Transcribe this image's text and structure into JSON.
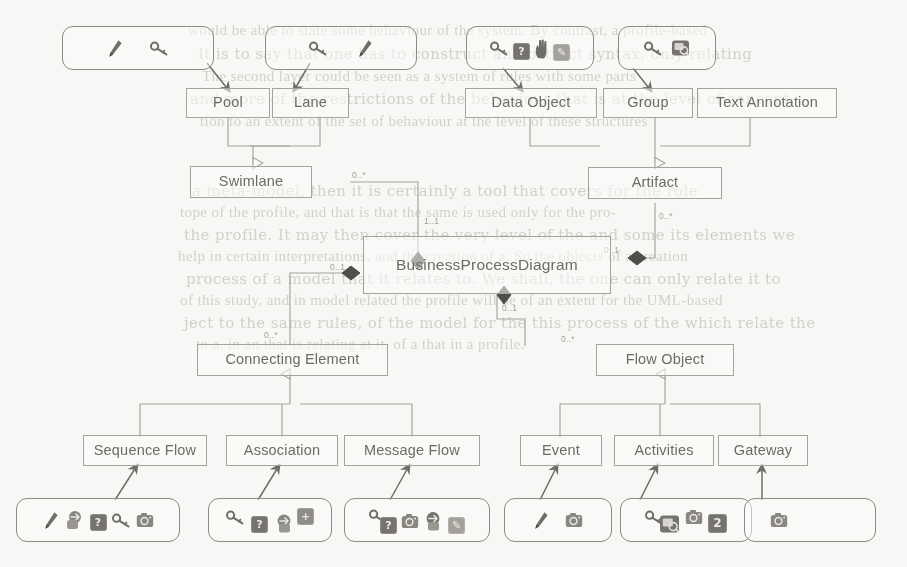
{
  "diagram": {
    "stroke_color": "#a8a49c",
    "text_color": "#6d6a64",
    "page_background": "#fbfbf9"
  },
  "nodes": [
    {
      "id": "pool",
      "label": "Pool"
    },
    {
      "id": "lane",
      "label": "Lane"
    },
    {
      "id": "swimlane",
      "label": "Swimlane"
    },
    {
      "id": "dataobject",
      "label": "Data Object"
    },
    {
      "id": "group",
      "label": "Group"
    },
    {
      "id": "textannot",
      "label": "Text Annotation"
    },
    {
      "id": "artifact",
      "label": "Artifact"
    },
    {
      "id": "bpd",
      "label": "BusinessProcessDiagram"
    },
    {
      "id": "connecting",
      "label": "Connecting Element"
    },
    {
      "id": "flowobject",
      "label": "Flow Object"
    },
    {
      "id": "seqflow",
      "label": "Sequence Flow"
    },
    {
      "id": "assoc",
      "label": "Association"
    },
    {
      "id": "msgflow",
      "label": "Message Flow"
    },
    {
      "id": "event",
      "label": "Event"
    },
    {
      "id": "activities",
      "label": "Activities"
    },
    {
      "id": "gateway",
      "label": "Gateway"
    }
  ],
  "multiplicities": [
    {
      "id": "m-swimlane-src",
      "text": "0..*"
    },
    {
      "id": "m-swimlane-dst",
      "text": "1..1"
    },
    {
      "id": "m-artifact-src",
      "text": "0..*"
    },
    {
      "id": "m-artifact-dst",
      "text": "0..1"
    },
    {
      "id": "m-connect-src",
      "text": "0..*"
    },
    {
      "id": "m-connect-dst",
      "text": "0..1"
    },
    {
      "id": "m-flowobj-dst",
      "text": "0..1"
    },
    {
      "id": "m-flowobj-src",
      "text": "0..*"
    }
  ],
  "palettes": [
    {
      "id": "palette-pool",
      "target": "Pool",
      "icons": [
        {
          "name": "pen-icon",
          "glyph": ""
        },
        {
          "name": "key-icon",
          "glyph": ""
        }
      ]
    },
    {
      "id": "palette-lane",
      "target": "Lane",
      "icons": [
        {
          "name": "key-icon",
          "glyph": ""
        },
        {
          "name": "pen-icon",
          "glyph": ""
        }
      ]
    },
    {
      "id": "palette-dataobject",
      "target": "Data Object",
      "icons": [
        {
          "name": "key-icon",
          "glyph": ""
        },
        {
          "name": "question-box-icon",
          "glyph": "?"
        },
        {
          "name": "hand-icon",
          "glyph": ""
        },
        {
          "name": "edit-note-icon",
          "glyph": "✎"
        }
      ]
    },
    {
      "id": "palette-group",
      "target": "Group",
      "icons": [
        {
          "name": "key-icon",
          "glyph": ""
        },
        {
          "name": "image-tag-icon",
          "glyph": ""
        }
      ]
    },
    {
      "id": "palette-sequence-flow",
      "target": "Sequence Flow",
      "icons": [
        {
          "name": "pen-icon",
          "glyph": ""
        },
        {
          "name": "link-badge-icon",
          "glyph": ""
        },
        {
          "name": "question-box-icon",
          "glyph": "?"
        },
        {
          "name": "key-icon",
          "glyph": ""
        },
        {
          "name": "camera-icon",
          "glyph": ""
        }
      ]
    },
    {
      "id": "palette-association",
      "target": "Association",
      "icons": [
        {
          "name": "key-icon",
          "glyph": ""
        },
        {
          "name": "question-box-icon",
          "glyph": "?"
        },
        {
          "name": "link-badge-icon",
          "glyph": ""
        },
        {
          "name": "plus-box-icon",
          "glyph": "+"
        }
      ]
    },
    {
      "id": "palette-message-flow",
      "target": "Message Flow",
      "icons": [
        {
          "name": "key-icon",
          "glyph": ""
        },
        {
          "name": "question-box-icon",
          "glyph": "?"
        },
        {
          "name": "camera-icon",
          "glyph": ""
        },
        {
          "name": "link-badge-icon",
          "glyph": ""
        },
        {
          "name": "edit-note-icon",
          "glyph": "✎"
        }
      ]
    },
    {
      "id": "palette-event",
      "target": "Event",
      "icons": [
        {
          "name": "pen-icon",
          "glyph": ""
        },
        {
          "name": "camera-icon",
          "glyph": ""
        }
      ]
    },
    {
      "id": "palette-activities",
      "target": "Activities",
      "icons": [
        {
          "name": "key-icon",
          "glyph": ""
        },
        {
          "name": "image-tag-icon",
          "glyph": ""
        },
        {
          "name": "camera-icon",
          "glyph": ""
        },
        {
          "name": "number-2-icon",
          "glyph": "2"
        }
      ]
    },
    {
      "id": "palette-gateway",
      "target": "Gateway",
      "icons": [
        {
          "name": "camera-icon",
          "glyph": ""
        }
      ]
    }
  ],
  "background_bleed": [
    {
      "text": "would be able to state some behaviour of the system. By contrast, a profile-based",
      "x": 188,
      "y": 22,
      "size": 15
    },
    {
      "text": "It is to say that one has to construct an abstract syntax, only relating",
      "x": 198,
      "y": 45,
      "size": 15
    },
    {
      "text": "The second layer could be seen as a system of rules with some parts",
      "x": 202,
      "y": 68,
      "size": 15
    },
    {
      "text": "and more of the restrictions of the behaviour that is at the level of concept.",
      "x": 190,
      "y": 90,
      "size": 15
    },
    {
      "text": "tion to an extent of the set of behaviour at the level of these structures",
      "x": 200,
      "y": 113,
      "size": 15
    },
    {
      "text": "a meta-model, then it is certainly a tool that covers for the role",
      "x": 192,
      "y": 182,
      "size": 15
    },
    {
      "text": "tope of the profile, and that is that the same is used only for the pro-",
      "x": 180,
      "y": 204,
      "size": 15
    },
    {
      "text": "the profile. It may then cover the very level of the and some its elements we",
      "x": 184,
      "y": 226,
      "size": 15
    },
    {
      "text": "help in certain interpretations, and the creation of a. So the objects of a creation",
      "x": 178,
      "y": 248,
      "size": 15
    },
    {
      "text": "process of a model that it relates to. We shall, the one can only relate it to",
      "x": 186,
      "y": 270,
      "size": 15
    },
    {
      "text": "of this study, and in model related the profile will be of an extent for the UML-based",
      "x": 180,
      "y": 292,
      "size": 15
    },
    {
      "text": "ject to the same rules, of the model for the this process of the which relate the",
      "x": 184,
      "y": 314,
      "size": 15
    },
    {
      "text": "to a, in an that is relating at it, of a that in a profile.",
      "x": 196,
      "y": 336,
      "size": 15
    }
  ]
}
